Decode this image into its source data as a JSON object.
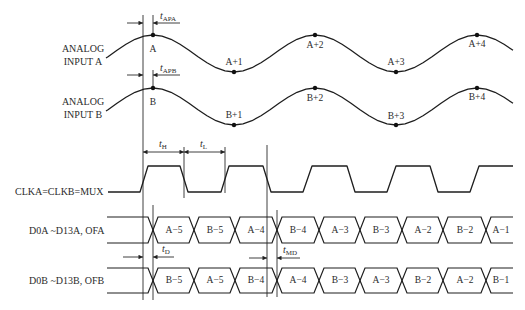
{
  "signals": {
    "analog_a": {
      "label_line1": "ANALOG",
      "label_line2": "INPUT A",
      "samples": [
        "A",
        "A+1",
        "A+2",
        "A+3",
        "A+4"
      ]
    },
    "analog_b": {
      "label_line1": "ANALOG",
      "label_line2": "INPUT B",
      "samples": [
        "B",
        "B+1",
        "B+2",
        "B+3",
        "B+4"
      ]
    },
    "clock": {
      "label": "CLKA=CLKB=MUX"
    },
    "data_a": {
      "label": "D0A ~D13A, OFA",
      "segments": [
        "A−5",
        "B−5",
        "A−4",
        "B−4",
        "A−3",
        "B−3",
        "A−2",
        "B−2",
        "A−1"
      ]
    },
    "data_b": {
      "label": "D0B ~D13B, OFB",
      "segments": [
        "B−5",
        "A−5",
        "B−4",
        "A−4",
        "B−3",
        "A−3",
        "B−2",
        "A−2",
        "B−1"
      ]
    }
  },
  "timing": {
    "t_apa": {
      "symbol": "t",
      "subscript": "APA"
    },
    "t_apb": {
      "symbol": "t",
      "subscript": "APB"
    },
    "t_h": {
      "symbol": "t",
      "subscript": "H"
    },
    "t_l": {
      "symbol": "t",
      "subscript": "L"
    },
    "t_d": {
      "symbol": "t",
      "subscript": "D"
    },
    "t_md": {
      "symbol": "t",
      "subscript": "MD"
    }
  },
  "colors": {
    "line": "#1e1e1e",
    "text": "#2b2b2b",
    "background": "#ffffff"
  }
}
